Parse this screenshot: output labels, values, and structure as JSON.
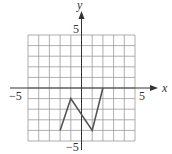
{
  "chart_data": {
    "type": "line",
    "title": "",
    "xlabel": "x",
    "ylabel": "y",
    "xlim": [
      -5,
      5
    ],
    "ylim": [
      -5,
      5
    ],
    "grid": true,
    "grid_step": 1,
    "tick_labels": {
      "x": [
        {
          "value": -5,
          "label": "−5"
        },
        {
          "value": 5,
          "label": "5"
        }
      ],
      "y": [
        {
          "value": 5,
          "label": "5"
        },
        {
          "value": -5,
          "label": "−5"
        }
      ]
    },
    "series": [
      {
        "name": "graph",
        "points": [
          [
            -2,
            -4
          ],
          [
            -1,
            -1
          ],
          [
            1,
            -4
          ],
          [
            2,
            0
          ]
        ],
        "color": "#555555"
      }
    ],
    "legend": null
  },
  "labels": {
    "x_axis": "x",
    "y_axis": "y",
    "x_neg": "−5",
    "x_pos": "5",
    "y_pos": "5",
    "y_neg": "−5"
  },
  "colors": {
    "grid": "#9a9a9a",
    "axis": "#333333",
    "line": "#555555"
  }
}
